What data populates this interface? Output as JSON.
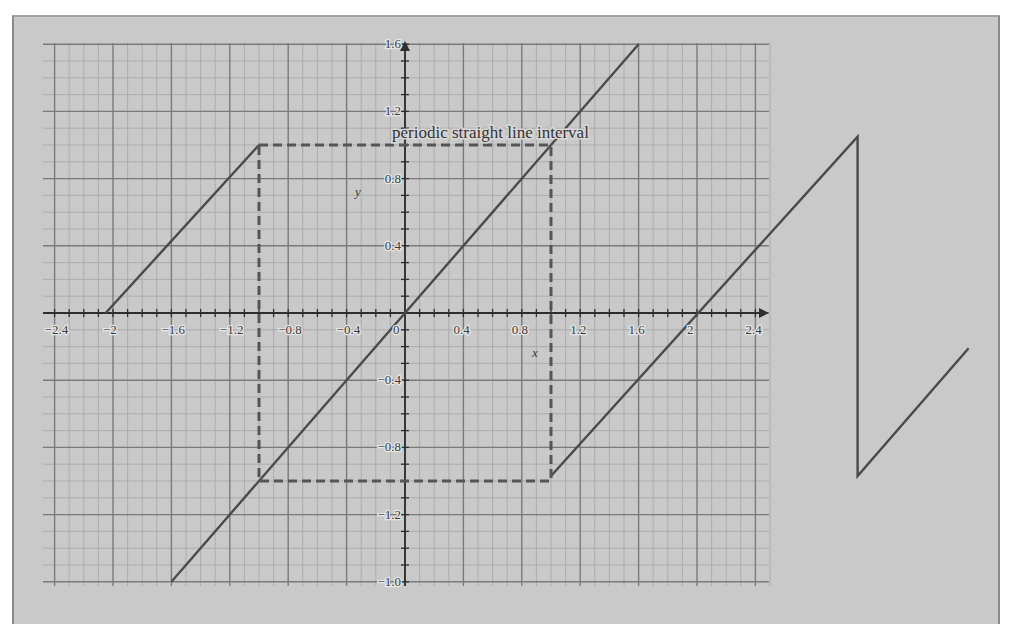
{
  "chart_data": {
    "type": "line",
    "title": "",
    "annotation": "periodic straight line interval",
    "xlabel": "x",
    "ylabel": "y",
    "xlim": [
      -2.4,
      2.4
    ],
    "ylim": [
      -1.6,
      1.6
    ],
    "grid": true,
    "legend": null,
    "x_ticks": [
      -2.4,
      -2,
      -1.6,
      -1.2,
      -0.8,
      -0.4,
      0,
      0.4,
      0.8,
      1.2,
      1.6,
      2,
      2.4
    ],
    "x_tick_labels": [
      "−2.4",
      "−2",
      "−1.6",
      "−1.2",
      "−0.8",
      "−0.4",
      "0",
      "0.4",
      "0.8",
      "1.2",
      "1.6",
      "2",
      "2.4"
    ],
    "y_ticks": [
      1.6,
      1.2,
      0.8,
      0.4,
      -0.4,
      -0.8,
      -1.2,
      -1.6
    ],
    "y_tick_labels": [
      "1.6",
      "1.2",
      "0.8",
      "0.4",
      "−0.4",
      "−0.8",
      "−1.2",
      "−1.0"
    ],
    "series": [
      {
        "name": "periodic segment left",
        "style": "solid",
        "points": [
          [
            -2.05,
            0
          ],
          [
            -1.0,
            1.0
          ]
        ]
      },
      {
        "name": "y = x",
        "style": "solid",
        "points": [
          [
            -1.6,
            -1.6
          ],
          [
            1.6,
            1.6
          ]
        ]
      },
      {
        "name": "periodic segment right (sawtooth)",
        "style": "solid",
        "points": [
          [
            1.0,
            -0.97
          ],
          [
            3.1,
            1.05
          ],
          [
            3.1,
            -0.97
          ],
          [
            3.86,
            -0.21
          ]
        ]
      },
      {
        "name": "interval box",
        "style": "dashed",
        "points": [
          [
            -1.0,
            1.0
          ],
          [
            1.0,
            1.0
          ],
          [
            1.0,
            -1.0
          ],
          [
            -1.0,
            -1.0
          ],
          [
            -1.0,
            1.0
          ]
        ]
      }
    ]
  },
  "colors": {
    "background": "#c9c9c9",
    "grid_major": "#7a7a7a",
    "grid_minor": "#a9a9a9",
    "axis": "#2e2e2e",
    "line": "#4a4a4a",
    "dashed": "#555555"
  },
  "labels": {
    "annotation": "periodic straight line interval",
    "x_axis_name": "x",
    "y_axis_name": "y"
  }
}
